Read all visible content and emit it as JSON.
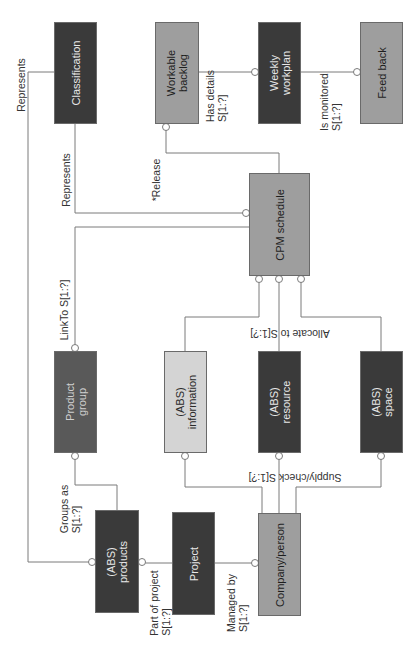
{
  "diagram": {
    "orientation": "rotated 90° counter-clockwise",
    "colors": {
      "dark": "#3a3a3a",
      "dark_mid": "#595959",
      "medium": "#9e9e9e",
      "light": "#d4d4d4",
      "line": "#7a7a7a"
    },
    "entities": {
      "classification": "Classification",
      "workable_backlog": "Workable\nbacklog",
      "weekly_workplan": "Weekly\nworkplan",
      "feed_back": "Feed back",
      "cpm_schedule": "CPM schedule",
      "product_group": "Product\ngroup",
      "abs_information": "(ABS)\ninformation",
      "abs_resource": "(ABS)\nresource",
      "abs_space": "(ABS)\nspace",
      "abs_products": "(ABS)\nproducts",
      "project": "Project",
      "company_person": "Company/person"
    },
    "relations": {
      "represents_outer": "Represents",
      "represents_inner": "Represents",
      "release": "*Release",
      "has_details": "Has details\nS[1:?]",
      "is_monitored": "Is monitored\nS[1:?]",
      "link_to": "LinkTo S[1:?]",
      "allocate_to": "Allocate to S[1:?]",
      "supply_check": "Supply/check S[1:?]",
      "groups_as": "Groups as\nS[1:?]",
      "part_of_project": "Part of project\nS[1:?]",
      "managed_by": "Managed by\nS[1:?]"
    }
  }
}
